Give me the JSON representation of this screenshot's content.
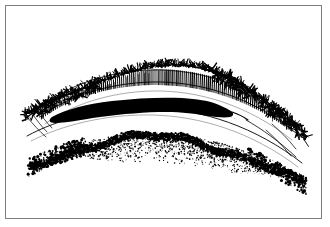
{
  "figure": {
    "title": "",
    "caption": "",
    "domain_kind": "scientific line illustration",
    "background_color": "#ffffff",
    "ink_color": "#000000",
    "frame": {
      "name": "figure-border",
      "stroke_color": "#7d7d7d",
      "stroke_width_px": 1.5,
      "x": 5,
      "y": 5,
      "width": 317,
      "height": 214
    },
    "drawing_bounds": {
      "x": 22,
      "y": 63,
      "width": 278,
      "height": 105
    },
    "layers": [
      {
        "name": "brush-border-layer",
        "label": "bristly stippled crest",
        "style": "scraggly short strokes",
        "color": "#000000",
        "order": 1
      },
      {
        "name": "palisade-layer",
        "label": "vertical hatched columnar band",
        "style": "closely spaced vertical tick marks",
        "color": "#000000",
        "order": 2
      },
      {
        "name": "thin-boundary-line-upper",
        "label": "upper boundary contour",
        "style": "continuous thin curve",
        "color": "#000000",
        "order": 3
      },
      {
        "name": "solid-black-lens",
        "label": "solid black lenticular band",
        "style": "filled opaque lens",
        "color": "#000000",
        "order": 4
      },
      {
        "name": "stipple-layer-upper",
        "label": "light stippled matrix",
        "style": "random dot stipple",
        "color": "#000000",
        "order": 5
      },
      {
        "name": "dark-granular-band",
        "label": "irregular dark granular band",
        "style": "dense clumped dots and flecks",
        "color": "#000000",
        "order": 6
      },
      {
        "name": "stipple-layer-lower",
        "label": "lower stippled matrix, fading out",
        "style": "random dot stipple, graded density",
        "color": "#000000",
        "order": 7
      },
      {
        "name": "thin-boundary-line-lower",
        "label": "lower boundary contour",
        "style": "continuous thin curve",
        "color": "#000000",
        "order": 8
      }
    ]
  }
}
